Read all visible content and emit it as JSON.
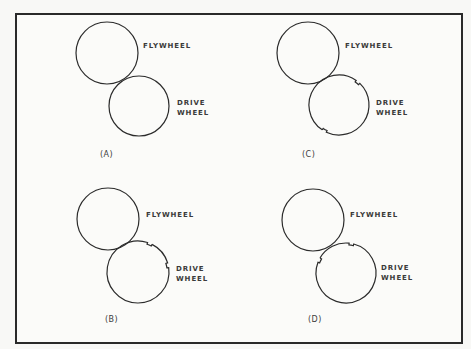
{
  "figure": {
    "frame": {
      "left": 15,
      "top": 13,
      "right": 461,
      "bottom": 342
    },
    "stroke_color": "#2b2b2b",
    "panels": [
      {
        "id": "A",
        "caption": "(A)",
        "caption_pos": [
          100,
          150
        ],
        "flywheel": {
          "label": "FLYWHEEL",
          "cx": 107,
          "cy": 53,
          "r": 31,
          "label_pos": [
            143,
            41
          ]
        },
        "drive_wheel": {
          "label_line1": "DRIVE",
          "label_line2": "WHEEL",
          "cx": 139,
          "cy": 106,
          "r": 30,
          "label_pos": [
            177,
            98
          ],
          "notches_deg": []
        }
      },
      {
        "id": "C",
        "caption": "(C)",
        "caption_pos": [
          302,
          150
        ],
        "flywheel": {
          "label": "FLYWHEEL",
          "cx": 308,
          "cy": 53,
          "r": 31,
          "label_pos": [
            345,
            41
          ]
        },
        "drive_wheel": {
          "label_line1": "DRIVE",
          "label_line2": "WHEEL",
          "cx": 339,
          "cy": 105,
          "r": 30,
          "label_pos": [
            376,
            98
          ],
          "notches_deg": [
            -55,
            115
          ]
        }
      },
      {
        "id": "B",
        "caption": "(B)",
        "caption_pos": [
          105,
          315
        ],
        "flywheel": {
          "label": "FLYWHEEL",
          "cx": 108,
          "cy": 219,
          "r": 31,
          "label_pos": [
            146,
            210
          ]
        },
        "drive_wheel": {
          "label_line1": "DRIVE",
          "label_line2": "WHEEL",
          "cx": 138,
          "cy": 272,
          "r": 31,
          "label_pos": [
            176,
            264
          ],
          "notches_deg": [
            -72,
            -17
          ]
        }
      },
      {
        "id": "D",
        "caption": "(D)",
        "caption_pos": [
          308,
          315
        ],
        "flywheel": {
          "label": "FLYWHEEL",
          "cx": 313,
          "cy": 220,
          "r": 31,
          "label_pos": [
            350,
            210
          ]
        },
        "drive_wheel": {
          "label_line1": "DRIVE",
          "label_line2": "WHEEL",
          "cx": 346,
          "cy": 273,
          "r": 30,
          "label_pos": [
            381,
            263
          ],
          "notches_deg": [
            -84,
            -159
          ]
        }
      }
    ]
  }
}
